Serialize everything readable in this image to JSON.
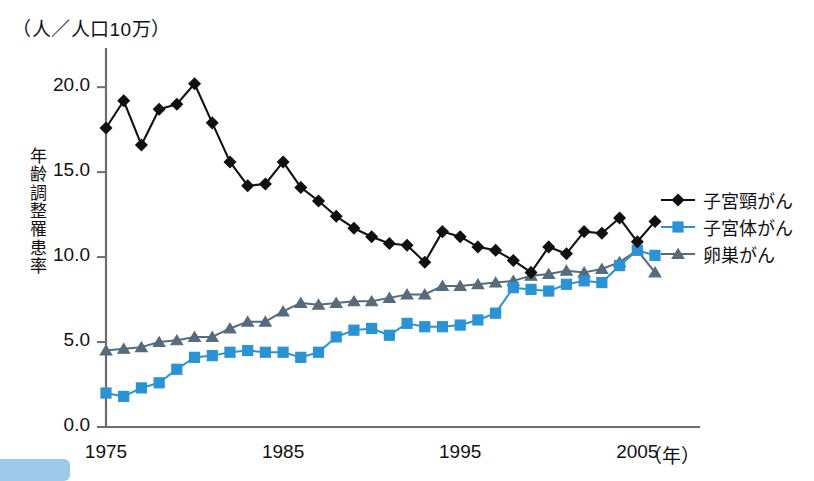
{
  "figure": {
    "unit_label": "（人／人口10万）",
    "y_axis_title_chars": [
      "年",
      "齢",
      "調",
      "整",
      "罹",
      "患",
      "率"
    ],
    "x_unit_label": "（年）"
  },
  "legend": {
    "position": "right",
    "items": [
      {
        "label": "子宮頸がん",
        "marker": "diamond-marker",
        "color": "#111111"
      },
      {
        "label": "子宮体がん",
        "marker": "square-marker",
        "color": "#2b93d4"
      },
      {
        "label": "卵巣がん",
        "marker": "triangle-marker",
        "color": "#566b7c"
      }
    ]
  },
  "chart_data": {
    "type": "line",
    "title": "",
    "xlabel": "（年）",
    "ylabel": "年齢調整罹患率",
    "unit": "（人／人口10万）",
    "xlim": [
      1975,
      1976
    ],
    "ylim": [
      0.0,
      22.0
    ],
    "yticks": [
      0.0,
      5.0,
      10.0,
      15.0,
      20.0
    ],
    "ytick_labels": [
      "0.0",
      "5.0",
      "10.0",
      "15.0",
      "20.0"
    ],
    "xticks": [
      1975,
      1985,
      1995,
      2005
    ],
    "xtick_labels": [
      "1975",
      "1985",
      "1995",
      "2005"
    ],
    "grid": false,
    "x": [
      1975,
      1976,
      1977,
      1978,
      1979,
      1980,
      1981,
      1982,
      1983,
      1984,
      1985,
      1986,
      1987,
      1988,
      1989,
      1990,
      1991,
      1992,
      1993,
      1994,
      1995,
      1996,
      1997,
      1998,
      1999,
      2000,
      2001,
      2002,
      2003,
      2004,
      2005,
      2006
    ],
    "series": [
      {
        "name": "子宮頸がん",
        "color": "#111111",
        "marker": "diamond",
        "values": [
          17.6,
          19.2,
          16.6,
          18.7,
          19.0,
          20.2,
          17.9,
          15.6,
          14.2,
          14.3,
          15.6,
          14.1,
          13.3,
          12.4,
          11.7,
          11.2,
          10.8,
          10.7,
          9.7,
          11.5,
          11.2,
          10.6,
          10.4,
          9.8,
          9.1,
          10.6,
          10.2,
          11.5,
          11.4,
          12.3,
          10.9,
          12.1
        ]
      },
      {
        "name": "子宮体がん",
        "color": "#2b93d4",
        "marker": "square",
        "values": [
          2.0,
          1.8,
          2.3,
          2.6,
          3.4,
          4.1,
          4.2,
          4.4,
          4.5,
          4.4,
          4.4,
          4.1,
          4.4,
          5.3,
          5.7,
          5.8,
          5.4,
          6.1,
          5.9,
          5.9,
          6.0,
          6.3,
          6.7,
          8.2,
          8.1,
          8.0,
          8.4,
          8.6,
          8.5,
          9.5,
          10.4,
          10.1
        ]
      },
      {
        "name": "卵巣がん",
        "color": "#566b7c",
        "marker": "triangle",
        "values": [
          4.5,
          4.6,
          4.7,
          5.0,
          5.1,
          5.3,
          5.3,
          5.8,
          6.2,
          6.2,
          6.8,
          7.3,
          7.2,
          7.3,
          7.4,
          7.4,
          7.6,
          7.8,
          7.8,
          8.3,
          8.3,
          8.4,
          8.5,
          8.6,
          8.9,
          9.0,
          9.2,
          9.1,
          9.3,
          9.7,
          10.4,
          9.1
        ]
      }
    ]
  }
}
